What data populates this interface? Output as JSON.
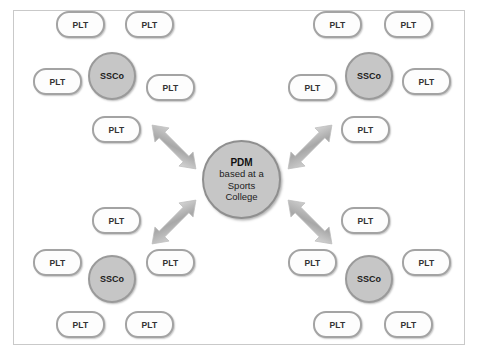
{
  "diagram": {
    "background_color": "#ffffff",
    "frame_color": "#c9c9c9",
    "node_fill_hub": "#c6c6c6",
    "node_fill_leaf": "#fdfdfd",
    "node_border": "#a3a3a3",
    "arrow_color": "#b4b4b4",
    "center": {
      "name": "pdm-node",
      "title": "PDM",
      "line2": "based at a",
      "line3": "Sports",
      "line4": "College",
      "x": 202,
      "y": 140
    },
    "clusters": [
      {
        "name": "cluster-top-left",
        "hub": {
          "label": "SSCo",
          "x": 88,
          "y": 52
        },
        "leaves": [
          {
            "label": "PLT",
            "x": 56,
            "y": 11
          },
          {
            "label": "PLT",
            "x": 125,
            "y": 11
          },
          {
            "label": "PLT",
            "x": 33,
            "y": 68
          },
          {
            "label": "PLT",
            "x": 146,
            "y": 74
          },
          {
            "label": "PLT",
            "x": 92,
            "y": 116
          }
        ]
      },
      {
        "name": "cluster-top-right",
        "hub": {
          "label": "SSCo",
          "x": 345,
          "y": 52
        },
        "leaves": [
          {
            "label": "PLT",
            "x": 313,
            "y": 11
          },
          {
            "label": "PLT",
            "x": 384,
            "y": 11
          },
          {
            "label": "PLT",
            "x": 288,
            "y": 74
          },
          {
            "label": "PLT",
            "x": 402,
            "y": 68
          },
          {
            "label": "PLT",
            "x": 341,
            "y": 116
          }
        ]
      },
      {
        "name": "cluster-bottom-left",
        "hub": {
          "label": "SSCo",
          "x": 88,
          "y": 255
        },
        "leaves": [
          {
            "label": "PLT",
            "x": 92,
            "y": 207
          },
          {
            "label": "PLT",
            "x": 33,
            "y": 249
          },
          {
            "label": "PLT",
            "x": 146,
            "y": 249
          },
          {
            "label": "PLT",
            "x": 56,
            "y": 311
          },
          {
            "label": "PLT",
            "x": 125,
            "y": 311
          }
        ]
      },
      {
        "name": "cluster-bottom-right",
        "hub": {
          "label": "SSCo",
          "x": 345,
          "y": 255
        },
        "leaves": [
          {
            "label": "PLT",
            "x": 341,
            "y": 207
          },
          {
            "label": "PLT",
            "x": 288,
            "y": 249
          },
          {
            "label": "PLT",
            "x": 402,
            "y": 249
          },
          {
            "label": "PLT",
            "x": 313,
            "y": 311
          },
          {
            "label": "PLT",
            "x": 384,
            "y": 311
          }
        ]
      }
    ],
    "connectors": [
      {
        "name": "arrow-pdm-to-top-left",
        "direction": "double",
        "from": "pdm",
        "to": "cluster-top-left"
      },
      {
        "name": "arrow-pdm-to-top-right",
        "direction": "double",
        "from": "pdm",
        "to": "cluster-top-right"
      },
      {
        "name": "arrow-pdm-to-bottom-left",
        "direction": "double",
        "from": "pdm",
        "to": "cluster-bottom-left"
      },
      {
        "name": "arrow-pdm-to-bottom-right",
        "direction": "double",
        "from": "pdm",
        "to": "cluster-bottom-right"
      }
    ]
  }
}
